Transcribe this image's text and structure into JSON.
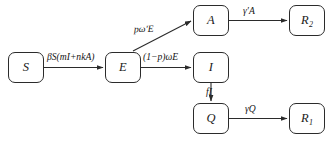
{
  "diagram": {
    "type": "compartmental-flow-diagram",
    "background_color": "#ffffff",
    "line_color": "#2b2b2b",
    "text_color": "#1a1a1a",
    "nodes": [
      {
        "id": "S",
        "label": "S",
        "subscript": ""
      },
      {
        "id": "E",
        "label": "E",
        "subscript": ""
      },
      {
        "id": "A",
        "label": "A",
        "subscript": ""
      },
      {
        "id": "I",
        "label": "I",
        "subscript": ""
      },
      {
        "id": "Q",
        "label": "Q",
        "subscript": ""
      },
      {
        "id": "R2",
        "label": "R",
        "subscript": "2"
      },
      {
        "id": "R1",
        "label": "R",
        "subscript": "1"
      }
    ],
    "edges": [
      {
        "id": "S-E",
        "from": "S",
        "to": "E",
        "label": "βS(mI+nkA)"
      },
      {
        "id": "E-A",
        "from": "E",
        "to": "A",
        "label": "pω′E"
      },
      {
        "id": "E-I",
        "from": "E",
        "to": "I",
        "label": "(1−p)ωE"
      },
      {
        "id": "A-R2",
        "from": "A",
        "to": "R2",
        "label": "γ′A"
      },
      {
        "id": "I-Q",
        "from": "I",
        "to": "Q",
        "label": "fI"
      },
      {
        "id": "Q-R1",
        "from": "Q",
        "to": "R1",
        "label": "γQ"
      }
    ]
  }
}
